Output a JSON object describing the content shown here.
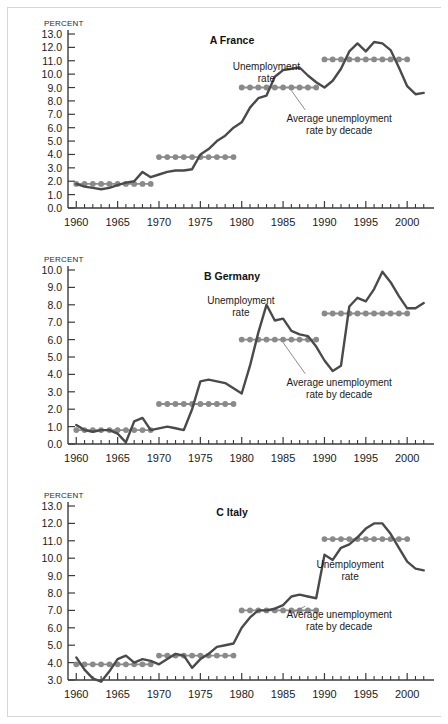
{
  "figure": {
    "axis_unit_label": "PERCENT",
    "series_labels": {
      "rate": "Unemployment\nrate",
      "average": "Average unemployment\nrate by decade"
    },
    "colors": {
      "rate_line": "#4a4a4a",
      "average_line": "#8c8c8c",
      "average_marker": "#8a8a8a",
      "axis": "#3b3b3b",
      "frame": "#d6d6d6",
      "background": "#ffffff"
    }
  },
  "chart_data": [
    {
      "type": "line",
      "panel_id": "A",
      "title": "A France",
      "xlabel": "",
      "ylabel": "PERCENT",
      "xlim": [
        1959,
        2003
      ],
      "ylim": [
        0.0,
        13.0
      ],
      "ytick_labels": [
        "0.0",
        "1.0",
        "2.0",
        "3.0",
        "4.0",
        "5.0",
        "6.0",
        "7.0",
        "8.0",
        "9.0",
        "10.0",
        "11.0",
        "12.0",
        "13.0"
      ],
      "ytick_values": [
        0,
        1,
        2,
        3,
        4,
        5,
        6,
        7,
        8,
        9,
        10,
        11,
        12,
        13
      ],
      "xtick_labels": [
        "1960",
        "1965",
        "1970",
        "1975",
        "1980",
        "1985",
        "1990",
        "1995",
        "2000"
      ],
      "xtick_values": [
        1960,
        1965,
        1970,
        1975,
        1980,
        1985,
        1990,
        1995,
        2000
      ],
      "grid": false,
      "legend": "annotated-inline",
      "series": [
        {
          "name": "Unemployment rate",
          "x": [
            1960,
            1961,
            1962,
            1963,
            1964,
            1965,
            1966,
            1967,
            1968,
            1969,
            1970,
            1971,
            1972,
            1973,
            1974,
            1975,
            1976,
            1977,
            1978,
            1979,
            1980,
            1981,
            1982,
            1983,
            1984,
            1985,
            1986,
            1987,
            1988,
            1989,
            1990,
            1991,
            1992,
            1993,
            1994,
            1995,
            1996,
            1997,
            1998,
            1999,
            2000,
            2001,
            2002
          ],
          "values": [
            1.8,
            1.6,
            1.5,
            1.4,
            1.5,
            1.7,
            1.9,
            2.0,
            2.7,
            2.3,
            2.5,
            2.7,
            2.8,
            2.8,
            2.9,
            4.0,
            4.4,
            5.0,
            5.4,
            6.0,
            6.4,
            7.5,
            8.2,
            8.4,
            9.8,
            10.3,
            10.4,
            10.5,
            9.9,
            9.4,
            9.0,
            9.5,
            10.4,
            11.7,
            12.3,
            11.7,
            12.4,
            12.3,
            11.8,
            10.5,
            9.1,
            8.5,
            8.6
          ],
          "style": "solid-dark"
        },
        {
          "name": "Average unemployment rate by decade",
          "x": [
            1960,
            1961,
            1962,
            1963,
            1964,
            1965,
            1966,
            1967,
            1968,
            1969,
            1970,
            1971,
            1972,
            1973,
            1974,
            1975,
            1976,
            1977,
            1978,
            1979,
            1980,
            1981,
            1982,
            1983,
            1984,
            1985,
            1986,
            1987,
            1988,
            1989,
            1990,
            1991,
            1992,
            1993,
            1994,
            1995,
            1996,
            1997,
            1998,
            1999,
            2000
          ],
          "values": [
            1.8,
            1.8,
            1.8,
            1.8,
            1.8,
            1.8,
            1.8,
            1.8,
            1.8,
            1.8,
            3.8,
            3.8,
            3.8,
            3.8,
            3.8,
            3.8,
            3.8,
            3.8,
            3.8,
            3.8,
            9.0,
            9.0,
            9.0,
            9.0,
            9.0,
            9.0,
            9.0,
            9.0,
            9.0,
            9.0,
            11.1,
            11.1,
            11.1,
            11.1,
            11.1,
            11.1,
            11.1,
            11.1,
            11.1,
            11.1,
            11.1
          ],
          "style": "stepped-with-markers",
          "decade_values": [
            1.8,
            3.8,
            9.0,
            11.1
          ]
        }
      ],
      "annotations": [
        {
          "text": "Unemployment\nrate",
          "x_frac": 0.545,
          "y_frac": 0.205
        },
        {
          "text": "Average unemployment\nrate by decade",
          "x_frac": 0.745,
          "y_frac": 0.505
        }
      ]
    },
    {
      "type": "line",
      "panel_id": "B",
      "title": "B Germany",
      "xlabel": "",
      "ylabel": "PERCENT",
      "xlim": [
        1959,
        2003
      ],
      "ylim": [
        0.0,
        10.0
      ],
      "ytick_labels": [
        "0.0",
        "1.0",
        "2.0",
        "3.0",
        "4.0",
        "5.0",
        "6.0",
        "7.0",
        "8.0",
        "9.0",
        "10.0"
      ],
      "ytick_values": [
        0,
        1,
        2,
        3,
        4,
        5,
        6,
        7,
        8,
        9,
        10
      ],
      "xtick_labels": [
        "1960",
        "1965",
        "1970",
        "1975",
        "1980",
        "1985",
        "1990",
        "1995",
        "2000"
      ],
      "xtick_values": [
        1960,
        1965,
        1970,
        1975,
        1980,
        1985,
        1990,
        1995,
        2000
      ],
      "grid": false,
      "legend": "annotated-inline",
      "series": [
        {
          "name": "Unemployment rate",
          "x": [
            1960,
            1961,
            1962,
            1963,
            1964,
            1965,
            1966,
            1967,
            1968,
            1969,
            1970,
            1971,
            1972,
            1973,
            1974,
            1975,
            1976,
            1977,
            1978,
            1979,
            1980,
            1981,
            1982,
            1983,
            1984,
            1985,
            1986,
            1987,
            1988,
            1989,
            1990,
            1991,
            1992,
            1993,
            1994,
            1995,
            1996,
            1997,
            1998,
            1999,
            2000,
            2001,
            2002
          ],
          "values": [
            1.1,
            0.8,
            0.7,
            0.8,
            0.8,
            0.6,
            0.1,
            1.3,
            1.5,
            0.8,
            0.9,
            1.0,
            0.9,
            0.8,
            2.0,
            3.6,
            3.7,
            3.6,
            3.5,
            3.2,
            2.9,
            4.5,
            6.4,
            8.0,
            7.1,
            7.2,
            6.5,
            6.3,
            6.2,
            5.6,
            4.8,
            4.2,
            4.5,
            7.9,
            8.4,
            8.2,
            8.9,
            9.9,
            9.3,
            8.5,
            7.8,
            7.8,
            8.1
          ],
          "style": "solid-dark"
        },
        {
          "name": "Average unemployment rate by decade",
          "x": [
            1960,
            1961,
            1962,
            1963,
            1964,
            1965,
            1966,
            1967,
            1968,
            1969,
            1970,
            1971,
            1972,
            1973,
            1974,
            1975,
            1976,
            1977,
            1978,
            1979,
            1980,
            1981,
            1982,
            1983,
            1984,
            1985,
            1986,
            1987,
            1988,
            1989,
            1990,
            1991,
            1992,
            1993,
            1994,
            1995,
            1996,
            1997,
            1998,
            1999,
            2000
          ],
          "values": [
            0.8,
            0.8,
            0.8,
            0.8,
            0.8,
            0.8,
            0.8,
            0.8,
            0.8,
            0.8,
            2.3,
            2.3,
            2.3,
            2.3,
            2.3,
            2.3,
            2.3,
            2.3,
            2.3,
            2.3,
            6.0,
            6.0,
            6.0,
            6.0,
            6.0,
            6.0,
            6.0,
            6.0,
            6.0,
            6.0,
            7.5,
            7.5,
            7.5,
            7.5,
            7.5,
            7.5,
            7.5,
            7.5,
            7.5,
            7.5,
            7.5
          ],
          "style": "stepped-with-markers",
          "decade_values": [
            0.8,
            2.3,
            6.0,
            7.5
          ]
        }
      ],
      "annotations": [
        {
          "text": "Unemployment\nrate",
          "x_frac": 0.475,
          "y_frac": 0.195
        },
        {
          "text": "Average unemployment\nrate by decade",
          "x_frac": 0.745,
          "y_frac": 0.665
        }
      ]
    },
    {
      "type": "line",
      "panel_id": "C",
      "title": "C Italy",
      "xlabel": "",
      "ylabel": "PERCENT",
      "xlim": [
        1959,
        2003
      ],
      "ylim": [
        3.0,
        13.0
      ],
      "ytick_labels": [
        "3.0",
        "4.0",
        "5.0",
        "6.0",
        "7.0",
        "8.0",
        "9.0",
        "10.0",
        "11.0",
        "12.0",
        "13.0"
      ],
      "ytick_values": [
        3,
        4,
        5,
        6,
        7,
        8,
        9,
        10,
        11,
        12,
        13
      ],
      "xtick_labels": [
        "1960",
        "1965",
        "1970",
        "1975",
        "1980",
        "1985",
        "1990",
        "1995",
        "2000"
      ],
      "xtick_values": [
        1960,
        1965,
        1970,
        1975,
        1980,
        1985,
        1990,
        1995,
        2000
      ],
      "grid": false,
      "legend": "annotated-inline",
      "series": [
        {
          "name": "Unemployment rate",
          "x": [
            1960,
            1961,
            1962,
            1963,
            1964,
            1965,
            1966,
            1967,
            1968,
            1969,
            1970,
            1971,
            1972,
            1973,
            1974,
            1975,
            1976,
            1977,
            1978,
            1979,
            1980,
            1981,
            1982,
            1983,
            1984,
            1985,
            1986,
            1987,
            1988,
            1989,
            1990,
            1991,
            1992,
            1993,
            1994,
            1995,
            1996,
            1997,
            1998,
            1999,
            2000,
            2001,
            2002
          ],
          "values": [
            4.3,
            3.6,
            3.1,
            2.9,
            3.5,
            4.2,
            4.4,
            4.0,
            4.2,
            4.1,
            3.9,
            4.2,
            4.5,
            4.4,
            3.7,
            4.2,
            4.5,
            4.9,
            5.0,
            5.1,
            6.0,
            6.6,
            7.0,
            7.0,
            7.1,
            7.3,
            7.8,
            7.9,
            7.8,
            7.7,
            10.2,
            9.9,
            10.6,
            10.8,
            11.2,
            11.7,
            12.0,
            12.0,
            11.4,
            10.6,
            9.8,
            9.4,
            9.3
          ],
          "style": "solid-dark"
        },
        {
          "name": "Average unemployment rate by decade",
          "x": [
            1960,
            1961,
            1962,
            1963,
            1964,
            1965,
            1966,
            1967,
            1968,
            1969,
            1970,
            1971,
            1972,
            1973,
            1974,
            1975,
            1976,
            1977,
            1978,
            1979,
            1980,
            1981,
            1982,
            1983,
            1984,
            1985,
            1986,
            1987,
            1988,
            1989,
            1990,
            1991,
            1992,
            1993,
            1994,
            1995,
            1996,
            1997,
            1998,
            1999,
            2000
          ],
          "values": [
            3.9,
            3.9,
            3.9,
            3.9,
            3.9,
            3.9,
            3.9,
            3.9,
            3.9,
            3.9,
            4.4,
            4.4,
            4.4,
            4.4,
            4.4,
            4.4,
            4.4,
            4.4,
            4.4,
            4.4,
            7.0,
            7.0,
            7.0,
            7.0,
            7.0,
            7.0,
            7.0,
            7.0,
            7.0,
            7.0,
            11.1,
            11.1,
            11.1,
            11.1,
            11.1,
            11.1,
            11.1,
            11.1,
            11.1,
            11.1,
            11.1
          ],
          "style": "stepped-with-markers",
          "decade_values": [
            3.9,
            4.4,
            7.0,
            11.1
          ]
        }
      ],
      "annotations": [
        {
          "text": "Unemployment\nrate",
          "x_frac": 0.775,
          "y_frac": 0.355
        },
        {
          "text": "Average unemployment\nrate by decade",
          "x_frac": 0.745,
          "y_frac": 0.645
        }
      ]
    }
  ]
}
